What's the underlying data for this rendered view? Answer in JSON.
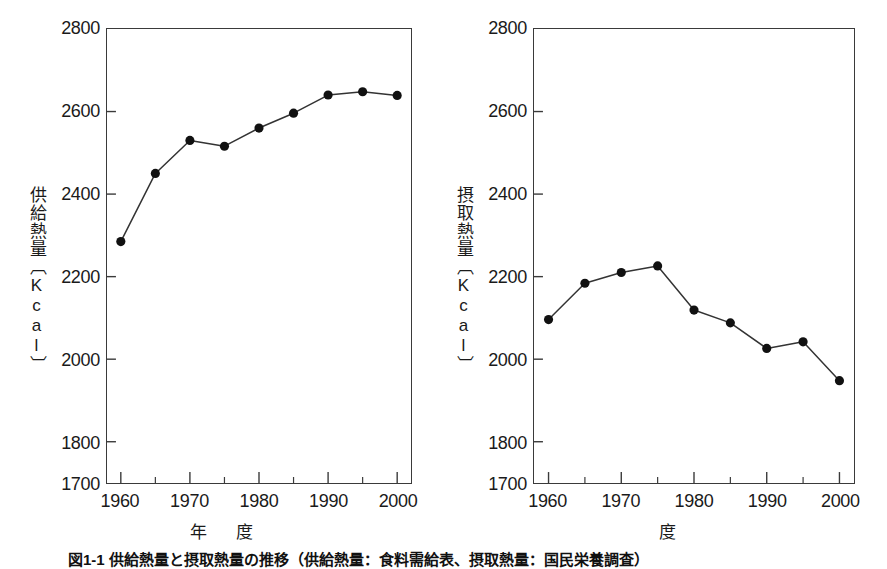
{
  "figure": {
    "caption": "図1-1 供給熱量と摂取熱量の推移（供給熱量：食料需給表、摂取熱量：国民栄養調査）"
  },
  "panels": [
    {
      "id": "supply",
      "ytitle": "供給熱量〔Kcal〕",
      "xtitle": "年　度",
      "yticks": [
        "2800",
        "2600",
        "2400",
        "2200",
        "2000",
        "1800",
        "1700"
      ],
      "xticks": [
        "1960",
        "1970",
        "1980",
        "1990",
        "2000"
      ]
    },
    {
      "id": "intake",
      "ytitle": "摂取熱量〔Kcal〕",
      "xtitle": "度",
      "yticks": [
        "2800",
        "2600",
        "2400",
        "2200",
        "2000",
        "1800",
        "1700"
      ],
      "xticks": [
        "1960",
        "1970",
        "1980",
        "1990",
        "2000"
      ]
    }
  ],
  "chart_data": [
    {
      "type": "line",
      "title": "供給熱量",
      "xlabel": "年　度",
      "ylabel": "供給熱量〔Kcal〕",
      "x": [
        1960,
        1965,
        1970,
        1975,
        1980,
        1985,
        1990,
        1995,
        2000
      ],
      "values": [
        2285,
        2450,
        2530,
        2516,
        2560,
        2596,
        2640,
        2648,
        2639
      ],
      "xlim": [
        1958,
        2002
      ],
      "ylim": [
        1700,
        2800
      ],
      "ytick_values": [
        1700,
        1800,
        2000,
        2200,
        2400,
        2600,
        2800
      ],
      "xtick_values": [
        1960,
        1970,
        1980,
        1990,
        2000
      ],
      "xminor_values": [
        1965,
        1975,
        1985,
        1995
      ],
      "grid": false,
      "legend": "none",
      "marker": "filled-circle",
      "line_color": "#333333",
      "marker_color": "#111111"
    },
    {
      "type": "line",
      "title": "摂取熱量",
      "xlabel": "度",
      "ylabel": "摂取熱量〔Kcal〕",
      "x": [
        1960,
        1965,
        1970,
        1975,
        1980,
        1985,
        1990,
        1995,
        2000
      ],
      "values": [
        2096,
        2184,
        2210,
        2226,
        2119,
        2088,
        2026,
        2042,
        1948
      ],
      "xlim": [
        1958,
        2002
      ],
      "ylim": [
        1700,
        2800
      ],
      "ytick_values": [
        1700,
        1800,
        2000,
        2200,
        2400,
        2600,
        2800
      ],
      "xtick_values": [
        1960,
        1970,
        1980,
        1990,
        2000
      ],
      "xminor_values": [
        1965,
        1975,
        1985,
        1995
      ],
      "grid": false,
      "legend": "none",
      "marker": "filled-circle",
      "line_color": "#333333",
      "marker_color": "#111111"
    }
  ]
}
